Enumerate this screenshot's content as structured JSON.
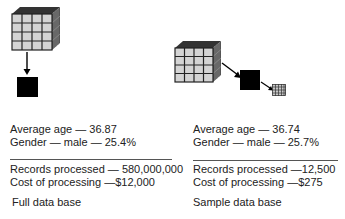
{
  "left": {
    "average_age": "Average age — 36.87",
    "gender": "Gender — male — 25.4%",
    "records": "Records processed — 580,000,000",
    "cost": "Cost of processing —$12,000",
    "caption": "Full data base"
  },
  "right": {
    "average_age": "Average age — 36.74",
    "gender": "Gender — male — 25.7%",
    "records": "Records processed —12,500",
    "cost": "Cost of processing —$275",
    "caption": "Sample data base"
  },
  "icons": {
    "full_cube": "data-cube-icon",
    "arrow": "arrow-icon",
    "black_square": "processed-block-icon",
    "small_grid": "sample-grid-icon"
  },
  "colors": {
    "cell": "#d4d4d4",
    "grid_line": "#222222",
    "block": "#000000",
    "text": "#222222"
  }
}
